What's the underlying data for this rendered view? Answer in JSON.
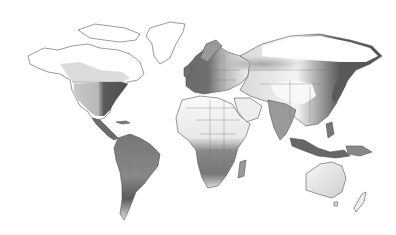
{
  "map": {
    "type": "world-map",
    "projection": "equirectangular",
    "style": "grayscale density choropleth",
    "colors": {
      "background": "#ffffff",
      "outline": "#555555",
      "low": "#f4f4f4",
      "mid": "#b0b0b0",
      "high": "#4a4a4a"
    },
    "regions": [
      {
        "name": "north-america-east",
        "intensity": "high"
      },
      {
        "name": "north-america-west",
        "intensity": "medium"
      },
      {
        "name": "canada-north",
        "intensity": "none"
      },
      {
        "name": "greenland",
        "intensity": "none"
      },
      {
        "name": "central-america",
        "intensity": "high"
      },
      {
        "name": "south-america",
        "intensity": "medium-high"
      },
      {
        "name": "europe",
        "intensity": "high"
      },
      {
        "name": "russia-band",
        "intensity": "medium"
      },
      {
        "name": "siberia",
        "intensity": "none"
      },
      {
        "name": "north-africa",
        "intensity": "none"
      },
      {
        "name": "southern-africa",
        "intensity": "medium-high"
      },
      {
        "name": "middle-east",
        "intensity": "low"
      },
      {
        "name": "india",
        "intensity": "medium"
      },
      {
        "name": "china-east",
        "intensity": "high"
      },
      {
        "name": "southeast-asia",
        "intensity": "high"
      },
      {
        "name": "australia",
        "intensity": "low"
      },
      {
        "name": "new-zealand",
        "intensity": "low"
      }
    ]
  }
}
